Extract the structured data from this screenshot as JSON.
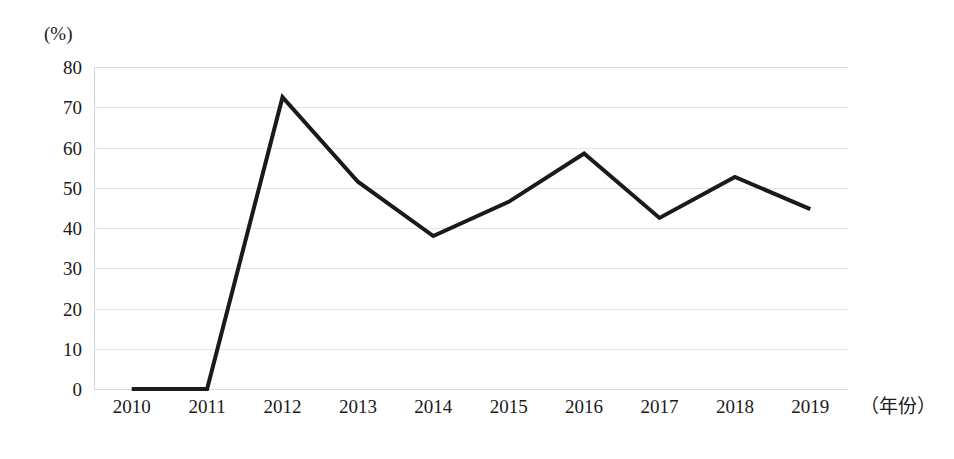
{
  "chart_data": {
    "type": "line",
    "title": "",
    "subtitle": "",
    "xlabel": "（年份）",
    "ylabel": "(%)",
    "categories": [
      "2010",
      "2011",
      "2012",
      "2013",
      "2014",
      "2015",
      "2016",
      "2017",
      "2018",
      "2019"
    ],
    "series": [
      {
        "name": "",
        "values": [
          0,
          0,
          72.5,
          51.5,
          38,
          46.5,
          58.5,
          42.5,
          52.7,
          44.7
        ],
        "color": "#1a1a1a",
        "line_width": 4
      }
    ],
    "ylim": [
      0,
      80
    ],
    "yticks": [
      0,
      10,
      20,
      30,
      40,
      50,
      60,
      70,
      80
    ],
    "ytick_labels": [
      "0",
      "10",
      "20",
      "30",
      "40",
      "50",
      "60",
      "70",
      "80"
    ],
    "grid": true,
    "grid_axis": "y",
    "grid_color": "#e2e3e6",
    "legend": false,
    "legend_position": "none",
    "background_color": "#ffffff",
    "markers": false,
    "annotations": []
  },
  "axes": {
    "y_unit": "(%)",
    "x_axis_caption": "（年份）"
  }
}
